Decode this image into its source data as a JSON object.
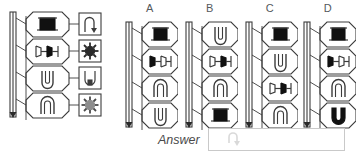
{
  "figure": {
    "type": "abstract-reasoning-matrix",
    "title": ""
  },
  "stem": {
    "name": "stem-panel",
    "slider": {
      "name": "vertical-slider",
      "has_arrow": true,
      "arrow_position": "bottom"
    },
    "cells": [
      {
        "index": 0,
        "shape": "top-hat-filled",
        "side_icon": "hook-arrow-icon"
      },
      {
        "index": 1,
        "shape": "double-spool-half-filled",
        "side_icon": "sunburst-dark-icon"
      },
      {
        "index": 2,
        "shape": "u-open-up",
        "side_icon": "u-in-square-icon"
      },
      {
        "index": 3,
        "shape": "arch-open-down",
        "side_icon": "sunburst-grey-icon"
      }
    ]
  },
  "options": [
    {
      "label": "A",
      "name": "option-a",
      "slider": {
        "name": "vertical-slider",
        "has_arrow": true,
        "arrow_position": "bottom"
      },
      "cells": [
        {
          "index": 0,
          "shape": "top-hat-filled"
        },
        {
          "index": 1,
          "shape": "double-spool-left-filled"
        },
        {
          "index": 2,
          "shape": "arch-open-down"
        },
        {
          "index": 3,
          "shape": "u-open-up"
        }
      ]
    },
    {
      "label": "B",
      "name": "option-b",
      "slider": {
        "name": "vertical-slider",
        "has_arrow": true,
        "arrow_position": "bottom"
      },
      "cells": [
        {
          "index": 0,
          "shape": "u-open-up"
        },
        {
          "index": 1,
          "shape": "double-spool-right-filled"
        },
        {
          "index": 2,
          "shape": "arch-open-down"
        },
        {
          "index": 3,
          "shape": "top-hat-filled"
        }
      ]
    },
    {
      "label": "C",
      "name": "option-c",
      "slider": {
        "name": "vertical-slider",
        "has_arrow": true,
        "arrow_position": "bottom"
      },
      "cells": [
        {
          "index": 0,
          "shape": "top-hat-filled"
        },
        {
          "index": 1,
          "shape": "u-open-up"
        },
        {
          "index": 2,
          "shape": "double-spool-right-filled"
        },
        {
          "index": 3,
          "shape": "arch-open-down"
        }
      ]
    },
    {
      "label": "D",
      "name": "option-d",
      "slider": {
        "name": "vertical-slider",
        "has_arrow": true,
        "arrow_position": "bottom"
      },
      "cells": [
        {
          "index": 0,
          "shape": "top-hat-filled"
        },
        {
          "index": 1,
          "shape": "double-spool-left-filled"
        },
        {
          "index": 2,
          "shape": "arch-open-down"
        },
        {
          "index": 3,
          "shape": "v-bold-filled"
        }
      ]
    }
  ],
  "answer": {
    "label": "Answer",
    "value": "",
    "placeholder": "",
    "cursor_icon": "mouse-pointer-icon"
  },
  "colors": {
    "stroke": "#3c3c3c",
    "fill_dark": "#111111",
    "fill_grey": "#8d8d8d",
    "label_text": "#55595c",
    "box_border": "#c9c9c9",
    "background": "#ffffff"
  }
}
